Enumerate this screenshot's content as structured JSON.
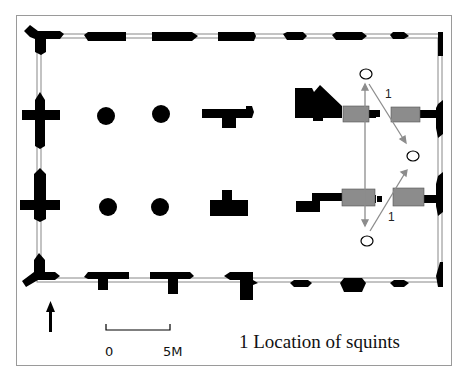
{
  "diagram": {
    "legend": {
      "number": "1",
      "text": "1 Location of squints"
    },
    "north_arrow": {
      "label": "N"
    },
    "scale_bar": {
      "start_label": "0",
      "end_label": "5M"
    },
    "squint_labels": [
      "1",
      "1"
    ],
    "colors": {
      "walls": "#000000",
      "squint_blocks": "#8c8c8c",
      "arrows": "#8c8c8c",
      "frame": "#9a9a9a"
    }
  }
}
